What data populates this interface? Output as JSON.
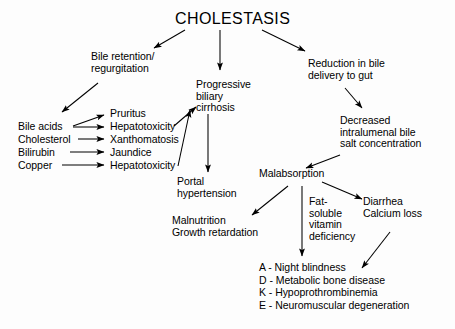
{
  "diagram": {
    "title": "CHOLESTASIS",
    "nodes": {
      "bile_retention": "Bile retention/\nregurgitation",
      "progressive_cirrhosis": "Progressive\nbiliary\ncirrhosis",
      "reduction_bile": "Reduction in bile\ndelivery to gut",
      "decreased_salt": "Decreased\nintralumenal bile\nsalt concentration",
      "portal_hypertension": "Portal\nhypertension",
      "malabsorption": "Malabsorption",
      "malnutrition": "Malnutrition\nGrowth retardation",
      "fat_soluble": "Fat-\nsoluble\nvitamin\ndeficiency",
      "diarrhea": "Diarrhea\nCalcium loss"
    },
    "substances": [
      {
        "name": "Bile acids",
        "effects": [
          "Pruritus",
          "Hepatotoxicity"
        ]
      },
      {
        "name": "Cholesterol",
        "effects": [
          "Xanthomatosis"
        ]
      },
      {
        "name": "Bilirubin",
        "effects": [
          "Jaundice"
        ]
      },
      {
        "name": "Copper",
        "effects": [
          "Hepatotoxicity"
        ]
      }
    ],
    "substance_labels": [
      "Bile acids",
      "Cholesterol",
      "Bilirubin",
      "Copper"
    ],
    "effect_labels": [
      "Pruritus",
      "Hepatotoxicity",
      "Xanthomatosis",
      "Jaundice",
      "Hepatotoxicity"
    ],
    "vitamin_deficiencies": "A - Night blindness\nD - Metabolic bone disease\nK - Hypoprothrombinemia\nE - Neuromuscular degeneration",
    "colors": {
      "ink": "#000000",
      "background": "#fdfdfd"
    }
  }
}
